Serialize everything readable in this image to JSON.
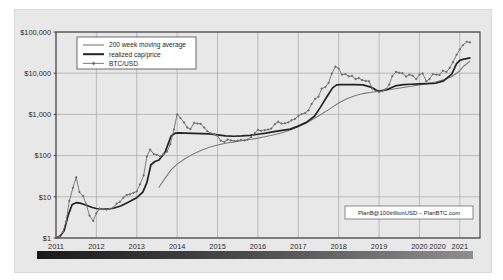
{
  "chart_data": {
    "type": "line",
    "title": "",
    "xlabel": "",
    "ylabel": "",
    "scale": "log",
    "grid": true,
    "ylim": [
      1,
      100000
    ],
    "xlim": [
      2011.0,
      2021.5
    ],
    "ytick_labels": [
      "$1",
      "$10",
      "$100",
      "$1,000",
      "$10,000",
      "$100,000"
    ],
    "ytick_values": [
      1,
      10,
      100,
      1000,
      10000,
      100000
    ],
    "xtick_labels": [
      "2011",
      "2012",
      "2013",
      "2014",
      "2015",
      "2016",
      "2017",
      "2018",
      "2019",
      "2020",
      "2020",
      "2021"
    ],
    "xtick_values": [
      2011,
      2012,
      2013,
      2014,
      2015,
      2016,
      2017,
      2018,
      2019,
      2020,
      2020.45,
      2021
    ],
    "legend_position": "top-left",
    "annotation": "PlanB@100trillionUSD – PlanBTC.com",
    "series": [
      {
        "name": "BTC/USD",
        "color": "#6f6f6f",
        "marker": "diamond",
        "x": [
          2011.0,
          2011.08,
          2011.17,
          2011.25,
          2011.33,
          2011.42,
          2011.5,
          2011.58,
          2011.67,
          2011.75,
          2011.83,
          2011.92,
          2012.0,
          2012.08,
          2012.17,
          2012.25,
          2012.33,
          2012.42,
          2012.5,
          2012.58,
          2012.67,
          2012.75,
          2012.83,
          2012.92,
          2013.0,
          2013.08,
          2013.17,
          2013.25,
          2013.33,
          2013.42,
          2013.5,
          2013.58,
          2013.67,
          2013.75,
          2013.83,
          2013.92,
          2014.0,
          2014.08,
          2014.17,
          2014.25,
          2014.33,
          2014.42,
          2014.5,
          2014.58,
          2014.67,
          2014.75,
          2014.83,
          2014.92,
          2015.0,
          2015.08,
          2015.17,
          2015.25,
          2015.33,
          2015.42,
          2015.5,
          2015.58,
          2015.67,
          2015.75,
          2015.83,
          2015.92,
          2016.0,
          2016.08,
          2016.17,
          2016.25,
          2016.33,
          2016.42,
          2016.5,
          2016.58,
          2016.67,
          2016.75,
          2016.83,
          2016.92,
          2017.0,
          2017.08,
          2017.17,
          2017.25,
          2017.33,
          2017.42,
          2017.5,
          2017.58,
          2017.67,
          2017.75,
          2017.83,
          2017.92,
          2018.0,
          2018.08,
          2018.17,
          2018.25,
          2018.33,
          2018.42,
          2018.5,
          2018.58,
          2018.67,
          2018.75,
          2018.83,
          2018.92,
          2019.0,
          2019.08,
          2019.17,
          2019.25,
          2019.33,
          2019.42,
          2019.5,
          2019.58,
          2019.67,
          2019.75,
          2019.83,
          2019.92,
          2020.0,
          2020.08,
          2020.17,
          2020.25,
          2020.33,
          2020.42,
          2020.5,
          2020.58,
          2020.67,
          2020.75,
          2020.83,
          2020.92,
          2021.0,
          2021.08,
          2021.17,
          2021.25
        ],
        "y": [
          1.0,
          1.1,
          1.4,
          2.5,
          8.0,
          16.5,
          30.0,
          13.0,
          10.5,
          6.5,
          3.5,
          2.6,
          4.0,
          5.2,
          5.0,
          4.9,
          5.1,
          5.5,
          6.8,
          7.5,
          9.5,
          11.0,
          11.5,
          12.5,
          13.5,
          20.0,
          33.0,
          95.0,
          140.0,
          110.0,
          105.0,
          95.0,
          110.0,
          125.0,
          190.0,
          430.0,
          1000.0,
          820.0,
          640.0,
          480.0,
          440.0,
          620.0,
          600.0,
          590.0,
          480.0,
          390.0,
          350.0,
          330.0,
          300.0,
          230.0,
          215.0,
          245.0,
          235.0,
          225.0,
          230.0,
          240.0,
          235.0,
          245.0,
          280.0,
          350.0,
          420.0,
          400.0,
          415.0,
          430.0,
          450.0,
          580.0,
          665.0,
          600.0,
          610.0,
          640.0,
          720.0,
          780.0,
          920.0,
          1020.0,
          1080.0,
          1250.0,
          1800.0,
          2400.0,
          2700.0,
          4200.0,
          4600.0,
          5800.0,
          9800.0,
          14500.0,
          13000.0,
          9200.0,
          9500.0,
          8400.0,
          8600.0,
          7200.0,
          7600.0,
          6800.0,
          6500.0,
          6400.0,
          4200.0,
          3700.0,
          3500.0,
          3650.0,
          4100.0,
          5300.0,
          8500.0,
          10800.0,
          10200.0,
          10000.0,
          8300.0,
          9200.0,
          8700.0,
          7200.0,
          9300.0,
          9900.0,
          6400.0,
          7200.0,
          9500.0,
          9200.0,
          9100.0,
          11500.0,
          10700.0,
          13500.0,
          18500.0,
          28000.0,
          38000.0,
          48000.0,
          58000.0,
          56000.0
        ]
      },
      {
        "name": "realized cap/price",
        "color": "#232323",
        "marker": "none",
        "x": [
          2011.0,
          2011.1,
          2011.2,
          2011.3,
          2011.4,
          2011.5,
          2011.6,
          2011.7,
          2011.8,
          2011.9,
          2012.0,
          2012.2,
          2012.4,
          2012.6,
          2012.8,
          2013.0,
          2013.15,
          2013.25,
          2013.35,
          2013.45,
          2013.55,
          2013.7,
          2013.85,
          2013.95,
          2014.05,
          2014.2,
          2014.4,
          2014.6,
          2014.8,
          2015.0,
          2015.2,
          2015.4,
          2015.6,
          2015.8,
          2016.0,
          2016.2,
          2016.4,
          2016.6,
          2016.8,
          2017.0,
          2017.2,
          2017.4,
          2017.55,
          2017.7,
          2017.85,
          2017.95,
          2018.05,
          2018.2,
          2018.4,
          2018.6,
          2018.8,
          2018.95,
          2019.0,
          2019.2,
          2019.4,
          2019.6,
          2019.8,
          2020.0,
          2020.2,
          2020.4,
          2020.6,
          2020.8,
          2020.92,
          2021.0,
          2021.1,
          2021.2,
          2021.25
        ],
        "y": [
          1.0,
          1.1,
          1.5,
          3.5,
          6.5,
          7.2,
          7.0,
          6.5,
          6.0,
          5.5,
          5.2,
          5.0,
          5.2,
          6.0,
          7.5,
          9.5,
          13.0,
          22.0,
          60.0,
          72.0,
          78.0,
          120.0,
          300.0,
          350.0,
          355.0,
          350.0,
          345.0,
          340.0,
          335.0,
          320.0,
          300.0,
          295.0,
          300.0,
          310.0,
          330.0,
          350.0,
          380.0,
          410.0,
          440.0,
          520.0,
          640.0,
          900.0,
          1500.0,
          2600.0,
          4400.0,
          5200.0,
          5300.0,
          5300.0,
          5300.0,
          5200.0,
          4600.0,
          3800.0,
          3700.0,
          4000.0,
          4900.0,
          5300.0,
          5400.0,
          5500.0,
          5600.0,
          5700.0,
          6500.0,
          9500.0,
          17000.0,
          20500.0,
          22000.0,
          23000.0,
          23500.0
        ]
      },
      {
        "name": "200 week moving average",
        "color": "#7d7d7d",
        "marker": "none",
        "x": [
          2013.55,
          2013.7,
          2013.85,
          2014.0,
          2014.2,
          2014.4,
          2014.6,
          2014.8,
          2015.0,
          2015.2,
          2015.4,
          2015.6,
          2015.8,
          2016.0,
          2016.2,
          2016.4,
          2016.6,
          2016.8,
          2017.0,
          2017.2,
          2017.4,
          2017.6,
          2017.8,
          2018.0,
          2018.2,
          2018.4,
          2018.6,
          2018.8,
          2019.0,
          2019.2,
          2019.4,
          2019.6,
          2019.8,
          2020.0,
          2020.2,
          2020.4,
          2020.6,
          2020.8,
          2021.0,
          2021.1,
          2021.25
        ],
        "y": [
          17.0,
          28.0,
          45.0,
          62.0,
          85.0,
          110.0,
          135.0,
          160.0,
          180.0,
          200.0,
          215.0,
          230.0,
          245.0,
          265.0,
          290.0,
          320.0,
          360.0,
          420.0,
          500.0,
          620.0,
          800.0,
          1050.0,
          1400.0,
          1900.0,
          2400.0,
          2850.0,
          3200.0,
          3450.0,
          3650.0,
          3900.0,
          4200.0,
          4500.0,
          4800.0,
          5200.0,
          5600.0,
          6100.0,
          6900.0,
          8200.0,
          11500.0,
          15000.0,
          19500.0
        ]
      }
    ]
  },
  "legend": {
    "items": [
      {
        "label": "200 week moving average"
      },
      {
        "label": "realized cap/price"
      },
      {
        "label": "BTC/USD"
      }
    ]
  },
  "watermark": {
    "text": "PlanB@100trillionUSD – PlanBTC.com"
  },
  "colorbar": {
    "name": "halving-color-bar"
  }
}
